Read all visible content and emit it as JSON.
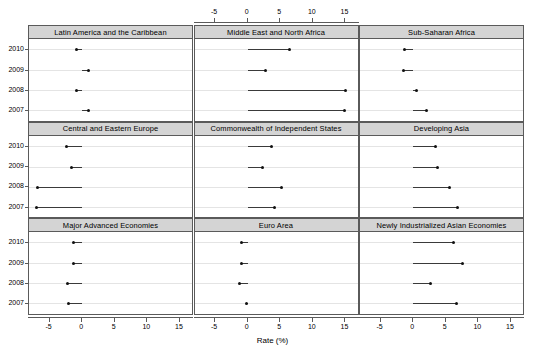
{
  "chart_data": {
    "type": "scatter",
    "title": "",
    "xlabel": "Rate (%)",
    "ylabel": "",
    "xlim": [
      -8,
      17
    ],
    "ylim_categories": [
      "2007",
      "2008",
      "2009",
      "2010"
    ],
    "xticks": [
      -5,
      0,
      5,
      10,
      15
    ],
    "xticklabels": [
      "-5",
      "0",
      "5",
      "10",
      "15"
    ],
    "grid": true,
    "legend": "none",
    "layout": "3x3 trellis of dot plots with reference line segment from 0 to value",
    "categories": [
      "2010",
      "2009",
      "2008",
      "2007"
    ],
    "panels": [
      {
        "name": "Latin America and the Caribbean",
        "row": 0,
        "col": 0,
        "values": {
          "2010": -0.8,
          "2009": 1.0,
          "2008": -0.9,
          "2007": 1.0
        }
      },
      {
        "name": "Middle East and North Africa",
        "row": 0,
        "col": 1,
        "values": {
          "2010": 6.4,
          "2009": 2.8,
          "2008": 15.0,
          "2007": 14.9
        }
      },
      {
        "name": "Sub-Saharan Africa",
        "row": 0,
        "col": 2,
        "values": {
          "2010": -1.4,
          "2009": -1.5,
          "2008": 0.5,
          "2007": 2.0
        }
      },
      {
        "name": "Central and Eastern Europe",
        "row": 1,
        "col": 0,
        "values": {
          "2010": -2.4,
          "2009": -1.6,
          "2008": -6.9,
          "2007": -7.0
        }
      },
      {
        "name": "Commonwealth of Independent States",
        "row": 1,
        "col": 1,
        "values": {
          "2010": 3.7,
          "2009": 2.3,
          "2008": 5.2,
          "2007": 4.1
        }
      },
      {
        "name": "Developing Asia",
        "row": 1,
        "col": 2,
        "values": {
          "2010": 3.4,
          "2009": 3.7,
          "2008": 5.5,
          "2007": 6.8
        }
      },
      {
        "name": "Major Advanced Economies",
        "row": 2,
        "col": 0,
        "values": {
          "2010": -1.3,
          "2009": -1.3,
          "2008": -2.2,
          "2007": -2.1
        }
      },
      {
        "name": "Euro Area",
        "row": 2,
        "col": 1,
        "values": {
          "2010": -1.0,
          "2009": -1.0,
          "2008": -1.2,
          "2007": -0.2
        }
      },
      {
        "name": "Newly Industrialized Asian Economies",
        "row": 2,
        "col": 2,
        "values": {
          "2010": 6.2,
          "2009": 7.5,
          "2008": 2.7,
          "2007": 6.7
        }
      }
    ]
  },
  "axes": {
    "x_title": "Rate (%)",
    "x_tick_labels": [
      "-5",
      "0",
      "5",
      "10",
      "15"
    ],
    "y_tick_labels": [
      "2010",
      "2009",
      "2008",
      "2007"
    ]
  },
  "strips": {
    "p0": "Latin America and the Caribbean",
    "p1": "Middle East and North Africa",
    "p2": "Sub-Saharan Africa",
    "p3": "Central and Eastern Europe",
    "p4": "Commonwealth of Independent States",
    "p5": "Developing Asia",
    "p6": "Major Advanced Economies",
    "p7": "Euro Area",
    "p8": "Newly Industrialized Asian Economies"
  },
  "colors": {
    "strip_bg": "#d4d4d4",
    "border": "#5a5a5a",
    "point": "#111111",
    "segment": "#3a3a3a",
    "grid": "#e4e4e4",
    "background": "#ffffff"
  }
}
